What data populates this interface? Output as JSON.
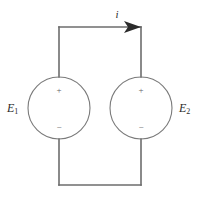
{
  "diagram": {
    "type": "electrical-circuit-schematic",
    "background_color": "#ffffff",
    "wire_color": "#6d6d6d",
    "circle_color": "#7a7a7a",
    "arrow_color": "#2b2b2b",
    "label_color": "#2b2b2b",
    "polarity_color": "#5f5f5f"
  },
  "current": {
    "symbol": "i",
    "arrow_direction": "right",
    "label_x": 117,
    "label_y": 18
  },
  "sources": [
    {
      "id": "left-source",
      "label_text": "E",
      "label_subscript": "1",
      "label_x": 7,
      "label_y": 109,
      "center_x": 59,
      "center_y": 108,
      "radius": 31,
      "plus_sign": "+",
      "minus_sign": "−",
      "plus_x": 59,
      "plus_y": 91,
      "minus_x": 59,
      "minus_y": 128
    },
    {
      "id": "right-source",
      "label_text": "E",
      "label_subscript": "2",
      "label_x": 179,
      "label_y": 109,
      "center_x": 141,
      "center_y": 108,
      "radius": 31,
      "plus_sign": "+",
      "minus_sign": "−",
      "plus_x": 141,
      "plus_y": 91,
      "minus_x": 141,
      "minus_y": 128
    }
  ],
  "wires": {
    "top_y": 27,
    "bottom_y": 185,
    "left_x": 59,
    "right_x": 141,
    "top_path": "M 59 27 L 141 27",
    "left_upper_path": "M 59 27 L 59 77",
    "left_lower_path": "M 59 139 L 59 185",
    "right_upper_path": "M 141 27 L 141 77",
    "right_lower_path": "M 141 139 L 141 185",
    "bottom_path": "M 59 185 L 141 185"
  },
  "arrow": {
    "points": "141,27 124,21 128,27 124,33"
  }
}
